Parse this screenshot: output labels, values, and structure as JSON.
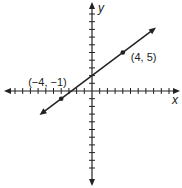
{
  "chart_data": {
    "type": "line",
    "title": "",
    "xlabel": "x",
    "ylabel": "y",
    "xlim": [
      -11,
      11
    ],
    "ylim": [
      -11,
      11
    ],
    "grid": false,
    "tick_labels": false,
    "series": [
      {
        "name": "line",
        "slope": 0.75,
        "intercept": 2,
        "x_range": [
          -6.5,
          8
        ],
        "arrows": "both"
      }
    ],
    "points": [
      {
        "x": 4,
        "y": 5,
        "label": "(4, 5)"
      },
      {
        "x": -4,
        "y": -1,
        "label": "(−4, −1)"
      }
    ]
  }
}
